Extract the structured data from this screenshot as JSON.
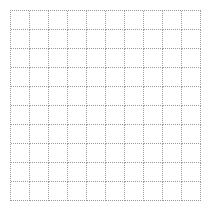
{
  "grid": {
    "rows": 10,
    "columns": 10,
    "line_color": "#9a9a9a",
    "line_style": "dotted",
    "background": "#ffffff"
  }
}
